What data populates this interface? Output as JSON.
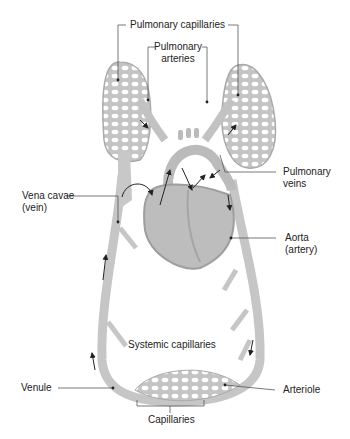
{
  "diagram": {
    "title": "",
    "colors": {
      "vessel": "#c8c8c8",
      "vessel_edge": "#a9a9a9",
      "heart": "#bdbdbd",
      "heart_dark": "#9e9e9e",
      "leader": "#555555",
      "arrow": "#222222",
      "text": "#222222"
    },
    "labels": {
      "pulmonary_capillaries": "Pulmonary capillaries",
      "pulmonary_arteries_1": "Pulmonary",
      "pulmonary_arteries_2": "arteries",
      "vena_cavae_1": "Vena cavae",
      "vena_cavae_2": "(vein)",
      "pulmonary_veins_1": "Pulmonary",
      "pulmonary_veins_2": "veins",
      "aorta_1": "Aorta",
      "aorta_2": "(artery)",
      "systemic_capillaries": "Systemic capillaries",
      "venule": "Venule",
      "arteriole": "Arteriole",
      "capillaries": "Capillaries"
    }
  }
}
